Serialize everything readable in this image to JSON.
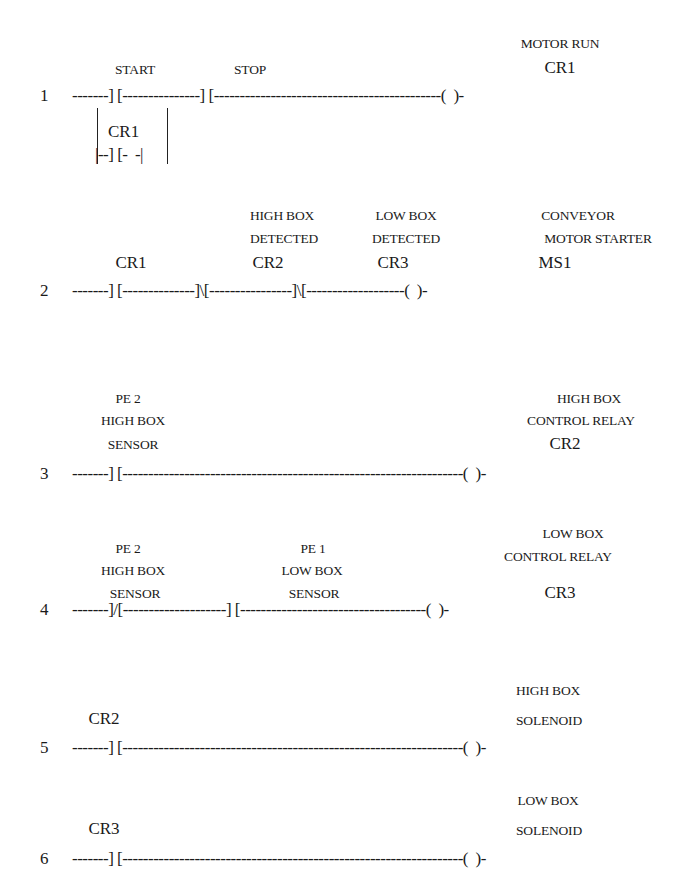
{
  "diagram": {
    "type": "ladder-logic",
    "rungs": [
      {
        "number": "1",
        "wire": "-------] [---------------] [--------------------------------------------(  )-",
        "labels": {
          "start": "START",
          "stop": "STOP",
          "output_desc": "MOTOR RUN",
          "output_tag": "CR1"
        },
        "branch": {
          "tag": "CR1",
          "wire": "|--] [-  -|"
        }
      },
      {
        "number": "2",
        "wire": "-------] [--------------]\\[----------------]\\[-------------------(  )-",
        "labels": {
          "contact1_tag": "CR1",
          "contact2_desc1": "HIGH BOX",
          "contact2_desc2": "DETECTED",
          "contact2_tag": "CR2",
          "contact3_desc1": "LOW BOX",
          "contact3_desc2": "DETECTED",
          "contact3_tag": "CR3",
          "output_desc1": "CONVEYOR",
          "output_desc2": "MOTOR STARTER",
          "output_tag": "MS1"
        }
      },
      {
        "number": "3",
        "wire": "-------] [------------------------------------------------------------------(  )-",
        "labels": {
          "contact1_desc1": "PE 2",
          "contact1_desc2": "HIGH BOX",
          "contact1_desc3": "SENSOR",
          "output_desc1": "HIGH BOX",
          "output_desc2": "CONTROL RELAY",
          "output_tag": "CR2"
        }
      },
      {
        "number": "4",
        "wire": "-------]/[--------------------] [------------------------------------(  )-",
        "labels": {
          "contact1_desc1": "PE 2",
          "contact1_desc2": "HIGH BOX",
          "contact1_desc3": "SENSOR",
          "contact2_desc1": "PE 1",
          "contact2_desc2": "LOW BOX",
          "contact2_desc3": "SENSOR",
          "output_desc1": "LOW BOX",
          "output_desc2": "CONTROL RELAY",
          "output_tag": "CR3"
        }
      },
      {
        "number": "5",
        "wire": "-------] [------------------------------------------------------------------(  )-",
        "labels": {
          "contact1_tag": "CR2",
          "output_desc1": "HIGH BOX",
          "output_desc2": "SOLENOID"
        }
      },
      {
        "number": "6",
        "wire": "-------] [------------------------------------------------------------------(  )-",
        "labels": {
          "contact1_tag": "CR3",
          "output_desc1": "LOW BOX",
          "output_desc2": "SOLENOID"
        }
      }
    ]
  }
}
